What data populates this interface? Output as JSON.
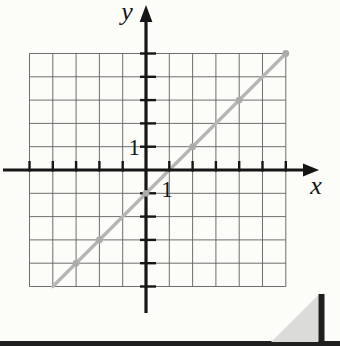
{
  "page": {
    "background": "#fcfcf8"
  },
  "chart_data": {
    "type": "line",
    "title": "",
    "xlabel": "x",
    "ylabel": "y",
    "x_tick_label": "1",
    "y_tick_label": "1",
    "grid": true,
    "xlim": [
      -5,
      6
    ],
    "ylim": [
      -5,
      5
    ],
    "equation": "y = x - 1",
    "series": [
      {
        "name": "y = x - 1",
        "x": [
          -4,
          6
        ],
        "y": [
          -5,
          5
        ],
        "marked_points": [
          [
            -3,
            -4
          ],
          [
            -2,
            -3
          ],
          [
            0,
            -1
          ],
          [
            2,
            1
          ],
          [
            4,
            3
          ],
          [
            6,
            5
          ]
        ]
      }
    ],
    "legend": false,
    "colors": {
      "line": "#b6b6b6",
      "points": "#ababab",
      "grid": "#5f5f5f",
      "axis": "#161616"
    }
  },
  "decor": {
    "bottom_bar_color": "#1f1f1f",
    "corner_bar_color": "#1f1f1f",
    "corner_triangle_color": "#dbdbd9"
  }
}
